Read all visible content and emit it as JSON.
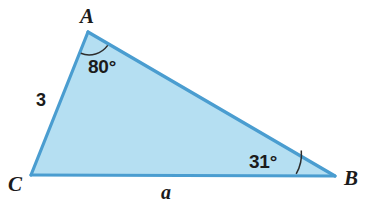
{
  "figure": {
    "kind": "triangle-diagram",
    "background_color": "#ffffff",
    "fill_color": "#b5dff2",
    "stroke_color": "#4a9dd0",
    "arc_color": "#2d2d2d",
    "text_color": "#1b1b1b",
    "vertices": {
      "A": {
        "label": "A",
        "x": 88,
        "y": 32
      },
      "B": {
        "label": "B",
        "x": 335,
        "y": 176
      },
      "C": {
        "label": "C",
        "x": 31,
        "y": 175
      }
    },
    "sides": [
      {
        "name": "side-b-CA",
        "label": "3",
        "from": "C",
        "to": "A"
      },
      {
        "name": "side-a-CB",
        "label": "a",
        "from": "C",
        "to": "B"
      },
      {
        "name": "side-c-AB",
        "label": "",
        "from": "A",
        "to": "B"
      }
    ],
    "angles": [
      {
        "name": "angle-at-A",
        "label": "80°",
        "vertex": "A",
        "value": 80
      },
      {
        "name": "angle-at-B",
        "label": "31°",
        "vertex": "B",
        "value": 31
      }
    ]
  }
}
